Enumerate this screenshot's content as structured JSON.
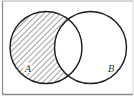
{
  "diagram": {
    "type": "venn",
    "sets": [
      {
        "id": "A",
        "label": "A",
        "cx": 46,
        "cy": 47.5,
        "r": 36
      },
      {
        "id": "B",
        "label": "B",
        "cx": 90.5,
        "cy": 47.5,
        "r": 36
      }
    ],
    "shaded_region": "A \\ B",
    "shading_style": "diagonal-hatch",
    "colors": {
      "stroke": "#1a1a1a",
      "hatch": "#555555",
      "frame": "#9a9a9a",
      "background": "#ffffff"
    }
  }
}
